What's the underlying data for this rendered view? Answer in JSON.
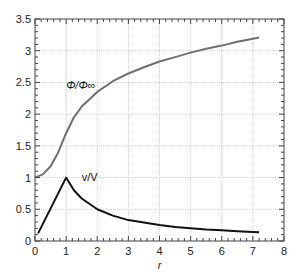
{
  "chart_data": {
    "type": "line",
    "title": "",
    "xlabel": "r",
    "ylabel": "",
    "xlim": [
      0,
      8
    ],
    "ylim": [
      0,
      3.5
    ],
    "grid": true,
    "xticks": [
      0,
      1,
      2,
      3,
      4,
      5,
      6,
      7,
      8
    ],
    "yticks": [
      0,
      0.5,
      1,
      1.5,
      2,
      2.5,
      3,
      3.5
    ],
    "xtick_labels": [
      "0",
      "1",
      "2",
      "3",
      "4",
      "5",
      "6",
      "7",
      "8"
    ],
    "ytick_labels": [
      "0",
      "0.5",
      "1",
      "1.5",
      "2",
      "2.5",
      "3",
      "3.5"
    ],
    "series": [
      {
        "name": "Φ/Φ∞",
        "color": "#707070",
        "x": [
          0,
          0.25,
          0.5,
          0.75,
          1.0,
          1.25,
          1.5,
          2.0,
          2.5,
          3.0,
          3.5,
          4.0,
          4.5,
          5.0,
          5.5,
          6.0,
          6.5,
          7.0,
          7.2
        ],
        "y": [
          1.0,
          1.05,
          1.18,
          1.4,
          1.7,
          1.95,
          2.12,
          2.35,
          2.52,
          2.64,
          2.74,
          2.83,
          2.9,
          2.97,
          3.03,
          3.08,
          3.14,
          3.19,
          3.21
        ]
      },
      {
        "name": "v/V",
        "color": "#111111",
        "x": [
          0.1,
          1.0,
          1.25,
          1.5,
          2.0,
          2.5,
          3.0,
          3.5,
          4.0,
          4.5,
          5.0,
          5.5,
          6.0,
          6.5,
          7.0,
          7.2
        ],
        "y": [
          0.12,
          1.0,
          0.8,
          0.67,
          0.5,
          0.4,
          0.33,
          0.29,
          0.25,
          0.22,
          0.2,
          0.18,
          0.17,
          0.155,
          0.143,
          0.139
        ]
      }
    ],
    "annotations": [
      {
        "text": "Φ/Φ∞",
        "x": 1.0,
        "y": 2.4
      },
      {
        "text": "v/V",
        "x": 1.5,
        "y": 0.95
      }
    ]
  }
}
